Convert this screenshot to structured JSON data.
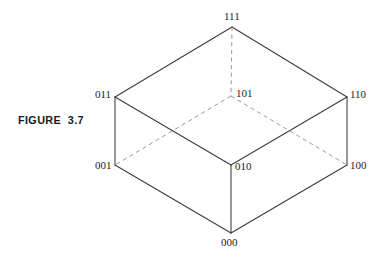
{
  "figure": {
    "caption": "FIGURE  3.7",
    "background_color": "#ffffff",
    "solid_edge_color": "#3a3a3a",
    "dashed_edge_color": "#8e8e8e"
  },
  "chart_data": {
    "type": "diagram",
    "title": "FIGURE  3.7",
    "subtitle": "",
    "xlabel": "",
    "ylabel": "",
    "grid": false,
    "legend": false,
    "nodes": [
      {
        "id": "111",
        "label": "111",
        "x": 232,
        "y": 27,
        "label_x": 224,
        "label_y": 11,
        "hidden": false
      },
      {
        "id": "011",
        "label": "011",
        "x": 115,
        "y": 97,
        "label_x": 95,
        "label_y": 89,
        "hidden": false
      },
      {
        "id": "110",
        "label": "110",
        "x": 347,
        "y": 97,
        "label_x": 350,
        "label_y": 89,
        "hidden": false
      },
      {
        "id": "101",
        "label": "101",
        "x": 231,
        "y": 96,
        "label_x": 236,
        "label_y": 88,
        "hidden": true
      },
      {
        "id": "001",
        "label": "001",
        "x": 115,
        "y": 165,
        "label_x": 95,
        "label_y": 160,
        "hidden": false
      },
      {
        "id": "010",
        "label": "010",
        "x": 231,
        "y": 165,
        "label_x": 235,
        "label_y": 161,
        "hidden": false
      },
      {
        "id": "100",
        "label": "100",
        "x": 347,
        "y": 165,
        "label_x": 350,
        "label_y": 160,
        "hidden": false
      },
      {
        "id": "000",
        "label": "000",
        "x": 231,
        "y": 233,
        "label_x": 221,
        "label_y": 237,
        "hidden": false
      }
    ],
    "edges": [
      {
        "from": "011",
        "to": "111",
        "style": "solid"
      },
      {
        "from": "111",
        "to": "110",
        "style": "solid"
      },
      {
        "from": "011",
        "to": "010",
        "style": "solid"
      },
      {
        "from": "010",
        "to": "110",
        "style": "solid"
      },
      {
        "from": "011",
        "to": "001",
        "style": "solid"
      },
      {
        "from": "110",
        "to": "100",
        "style": "solid"
      },
      {
        "from": "010",
        "to": "000",
        "style": "solid"
      },
      {
        "from": "001",
        "to": "000",
        "style": "solid"
      },
      {
        "from": "000",
        "to": "100",
        "style": "solid"
      },
      {
        "from": "111",
        "to": "101",
        "style": "dashed"
      },
      {
        "from": "101",
        "to": "001",
        "style": "dashed"
      },
      {
        "from": "101",
        "to": "100",
        "style": "dashed"
      }
    ]
  }
}
